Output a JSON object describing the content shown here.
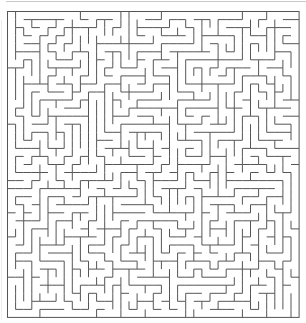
{
  "puzzle": {
    "type": "maze",
    "columns": 36,
    "rows": 38,
    "origin": {
      "x": 7.5,
      "y": 11.5
    },
    "cell_width": 8.1,
    "cell_height": 8.05,
    "seed": 20240517,
    "colors": {
      "wall": "#555555",
      "background": "#ffffff",
      "page_edge": "#c8c8c8"
    },
    "stroke_width": 1
  }
}
